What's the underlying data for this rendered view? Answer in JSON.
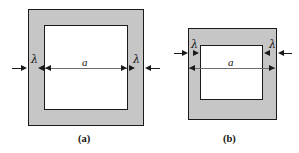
{
  "figure": {
    "type": "technical-diagram",
    "background_color": "#ffffff",
    "shade_color": "#c6c6c6",
    "line_color": "#1a1a1a",
    "dimension_line_color": "#6e6e6e"
  },
  "panels": [
    {
      "id": "a",
      "caption": "(a)",
      "labels": {
        "lambda_left": "λ",
        "lambda_right": "λ",
        "inner_width": "a"
      },
      "geometry": {
        "outer": {
          "x": 28,
          "y": 9,
          "width": 116,
          "height": 117
        },
        "inner": {
          "x": 44,
          "y": 25,
          "width": 84,
          "height": 85
        },
        "wall_thickness_px": 16,
        "dimension_line_y": 68
      }
    },
    {
      "id": "b",
      "caption": "(b)",
      "labels": {
        "lambda_left": "λ",
        "lambda_right": "λ",
        "inner_width": "a"
      },
      "geometry": {
        "outer": {
          "x": 188,
          "y": 28,
          "width": 89,
          "height": 92
        },
        "inner": {
          "x": 200,
          "y": 45,
          "width": 63,
          "height": 55
        },
        "wall_thickness_px": 13,
        "lambda_line_y": 53,
        "dimension_line_y": 68
      }
    }
  ]
}
